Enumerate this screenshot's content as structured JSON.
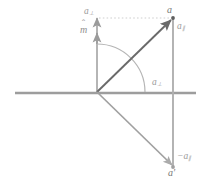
{
  "figure": {
    "background_color": "#ffffff",
    "width_px": 205,
    "height_px": 184
  },
  "colors": {
    "axis_horizontal": "#999999",
    "axis_vertical": "#a8a8a8",
    "vector_a": "#6a6a6a",
    "vector_a_prime": "#a0a0a0",
    "component_line": "#b0b0b0",
    "arc": "#b5b5b5",
    "guide_dotted": "#cfcfcf",
    "label_primary": "#777777",
    "label_secondary": "#9a9a9a"
  },
  "geometry": {
    "origin": {
      "x": 97,
      "y": 92
    },
    "point_a": {
      "x": 173,
      "y": 18
    },
    "point_a_prime": {
      "x": 173,
      "y": 167
    },
    "axis_horizontal": {
      "x1": 15,
      "y1": 93,
      "x2": 196,
      "y2": 93
    },
    "axis_vertical": {
      "x1": 97,
      "y1": 92,
      "x2": 97,
      "y2": 16
    },
    "vertical_right": {
      "x": 173,
      "y1": 18,
      "y2": 167
    },
    "arc_radius": 48
  },
  "labels": {
    "vector_a": {
      "base": "a",
      "sub": "",
      "text": "a"
    },
    "component_parallel": {
      "base": "a",
      "sub": "∥",
      "text": "a∥"
    },
    "component_perpendicular_top": {
      "base": "a",
      "sub": "⊥",
      "text": "a⊥"
    },
    "unit_normal": {
      "base": "m",
      "accent": "̂",
      "text": "m̂"
    },
    "component_perpendicular_axis": {
      "base": "a",
      "sub": "⊥",
      "text": "a⊥"
    },
    "component_parallel_negative": {
      "base": "−a",
      "sub": "∥",
      "text": "−a∥"
    },
    "vector_a_prime": {
      "base": "a",
      "prime": "′",
      "text": "a′"
    }
  },
  "elements": {
    "horizontal_axis_name": "horizontal reflection plane",
    "vertical_axis_name": "unit normal axis",
    "arc_name": "angle arc between normal and vector a",
    "diagonal_up_name": "vector a from origin",
    "diagonal_down_name": "reflected vector a-prime from origin",
    "guide_top_name": "dotted guide from normal axis tip to point a"
  }
}
